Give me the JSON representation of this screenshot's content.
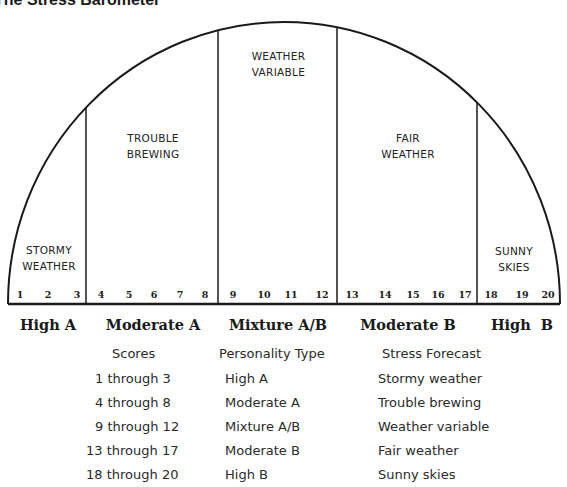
{
  "title": "The Stress Barometer",
  "barometer": {
    "zones": [
      {
        "label_line1": "STORMY",
        "label_line2": "WEATHER",
        "scores": [
          1,
          2,
          3
        ]
      },
      {
        "label_line1": "TROUBLE",
        "label_line2": "BREWING",
        "scores": [
          4,
          5,
          6,
          7,
          8
        ]
      },
      {
        "label_line1": "WEATHER",
        "label_line2": "VARIABLE",
        "scores": [
          9,
          10,
          11,
          12
        ]
      },
      {
        "label_line1": "FAIR",
        "label_line2": "WEATHER",
        "scores": [
          13,
          14,
          15,
          16,
          17
        ]
      },
      {
        "label_line1": "SUNNY",
        "label_line2": "SKIES",
        "scores": [
          18,
          19,
          20
        ]
      }
    ],
    "type_labels": [
      "High A",
      "Moderate A",
      "Mixture A/B",
      "Moderate B",
      "High  B"
    ]
  },
  "table": {
    "headers": [
      "Scores",
      "Personality Type",
      "Stress Forecast"
    ],
    "rows": [
      [
        "1 through 3",
        "High A",
        "Stormy weather"
      ],
      [
        "4 through 8",
        "Moderate A",
        "Trouble brewing"
      ],
      [
        "9 through 12",
        "Mixture A/B",
        "Weather variable"
      ],
      [
        "13 through 17",
        "Moderate B",
        "Fair weather"
      ],
      [
        "18 through 20",
        "High B",
        "Sunny skies"
      ]
    ]
  },
  "colors": {
    "line": "#1a1a1a",
    "background": "#ffffff"
  }
}
